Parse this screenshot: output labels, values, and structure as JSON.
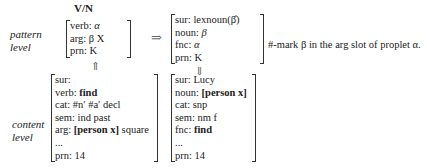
{
  "title": "V/N",
  "levels": {
    "pattern": [
      "pattern",
      "level"
    ],
    "content": [
      "content",
      "level"
    ]
  },
  "pattern_left": {
    "rows": [
      {
        "attr": "verb:",
        "val": "α"
      },
      {
        "attr": "arg:",
        "val": "β X"
      },
      {
        "attr": "prn:",
        "val": "K"
      }
    ]
  },
  "pattern_right": {
    "rows": [
      {
        "attr": "sur:",
        "val": "lexnoun(β̂)"
      },
      {
        "attr": "noun:",
        "val": "β"
      },
      {
        "attr": "fnc:",
        "val": "α"
      },
      {
        "attr": "prn:",
        "val": "K"
      }
    ]
  },
  "content_left": {
    "rows": [
      {
        "attr": "sur:",
        "val": ""
      },
      {
        "attr": "verb:",
        "val": "find",
        "bold": true
      },
      {
        "attr": "cat:",
        "val": "#n′ #a′ decl"
      },
      {
        "attr": "sem:",
        "val": "ind past"
      },
      {
        "attr": "arg:",
        "val_bold": "[person x]",
        "val": " square"
      },
      {
        "attr": "...",
        "val": ""
      },
      {
        "attr": "prn:",
        "val": "14"
      }
    ]
  },
  "content_right": {
    "rows": [
      {
        "attr": "sur:",
        "val": "Lucy"
      },
      {
        "attr": "noun:",
        "val_bold": "[person x]"
      },
      {
        "attr": "cat:",
        "val": "snp"
      },
      {
        "attr": "sem:",
        "val": "nm f"
      },
      {
        "attr": "fnc:",
        "val_bold": "find"
      },
      {
        "attr": "...",
        "val": ""
      },
      {
        "attr": "prn:",
        "val": "14"
      }
    ]
  },
  "arrows": {
    "transform": "⇒",
    "up": "⇑",
    "down": "⇓"
  },
  "note": "#-mark β in the arg slot of proplet α."
}
